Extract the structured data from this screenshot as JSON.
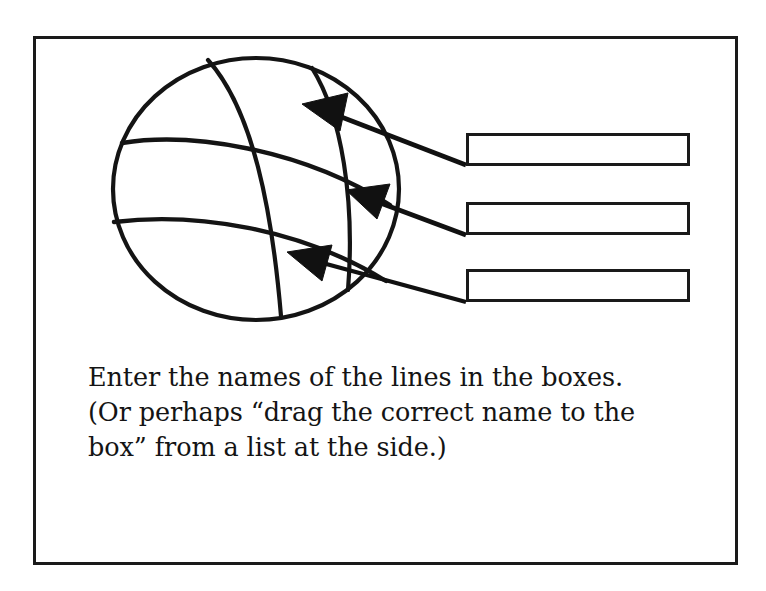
{
  "figure": {
    "kind": "instructional-diagram",
    "frame": {
      "stroke_color": "#1a1a1a",
      "fill_color": "#ffffff"
    },
    "background_color": "#ffffff",
    "ink_color": "#111111"
  },
  "globe": {
    "label": "globe-with-graticule",
    "outline_name": "globe-outline",
    "graticule": {
      "meridians": [
        {
          "name": "meridian-left-curve"
        },
        {
          "name": "meridian-center-curve"
        },
        {
          "name": "meridian-right-curve"
        }
      ],
      "parallels": [
        {
          "name": "parallel-upper-curve"
        },
        {
          "name": "parallel-lower-curve"
        }
      ]
    }
  },
  "callouts": [
    {
      "id": "callout-1",
      "arrow_name": "callout-arrow-1",
      "leader_name": "callout-leader-line-1",
      "target": "parallel-upper-curve",
      "box_id": "answer-box-1"
    },
    {
      "id": "callout-2",
      "arrow_name": "callout-arrow-2",
      "leader_name": "callout-leader-line-2",
      "target": "parallel-lower-curve",
      "box_id": "answer-box-2"
    },
    {
      "id": "callout-3",
      "arrow_name": "callout-arrow-3",
      "leader_name": "callout-leader-line-3",
      "target": "meridian-center-curve",
      "box_id": "answer-box-3"
    }
  ],
  "answer_boxes": [
    {
      "id": "answer-box-1",
      "value": "",
      "placeholder": ""
    },
    {
      "id": "answer-box-2",
      "value": "",
      "placeholder": ""
    },
    {
      "id": "answer-box-3",
      "value": "",
      "placeholder": ""
    }
  ],
  "caption": {
    "line1": "Enter the names of the lines in the boxes.",
    "line2": "(Or perhaps “drag the correct name to the",
    "line3": "box” from a list at the side.)",
    "full_text": "Enter the names of the lines in the boxes. (Or perhaps “drag the correct name to the box” from a list at the side.)"
  }
}
